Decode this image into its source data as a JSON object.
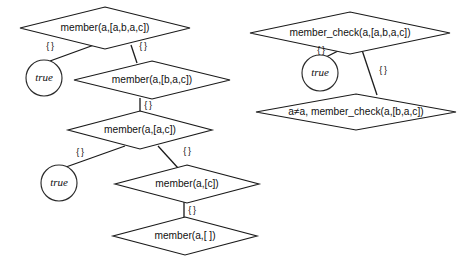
{
  "diagram": {
    "type": "sld-resolution-tree",
    "background_color": "#ffffff",
    "stroke_color": "#1a1a1a",
    "text_color": "#111111",
    "empty_substitution_label": "{ }",
    "trees": [
      {
        "id": "member-tree",
        "name": "member-resolution-tree",
        "root_predicate": "member",
        "nodes": [
          {
            "id": "m0",
            "name": "goal-node-member-abac",
            "shape": "diamond",
            "label": "member(a,[a,b,a,c])",
            "cx": 105,
            "cy": 28,
            "rx": 85,
            "ry": 21
          },
          {
            "id": "m1true",
            "name": "success-node-true-1",
            "shape": "circle",
            "label": "true",
            "cx": 44,
            "cy": 78,
            "r": 18
          },
          {
            "id": "m1",
            "name": "goal-node-member-bac",
            "shape": "diamond",
            "label": "member(a,[b,a,c])",
            "cx": 152,
            "cy": 80,
            "rx": 78,
            "ry": 19
          },
          {
            "id": "m2",
            "name": "goal-node-member-ac",
            "shape": "diamond",
            "label": "member(a,[a,c])",
            "cx": 140,
            "cy": 130,
            "rx": 72,
            "ry": 19
          },
          {
            "id": "m3true",
            "name": "success-node-true-2",
            "shape": "circle",
            "label": "true",
            "cx": 59,
            "cy": 183,
            "r": 18
          },
          {
            "id": "m3",
            "name": "goal-node-member-c",
            "shape": "diamond",
            "label": "member(a,[c])",
            "cx": 187,
            "cy": 184,
            "rx": 72,
            "ry": 19
          },
          {
            "id": "m4",
            "name": "goal-node-member-empty",
            "shape": "diamond",
            "label": "member(a,[ ])",
            "cx": 185,
            "cy": 236,
            "rx": 72,
            "ry": 19
          }
        ],
        "edges": [
          {
            "id": "me0",
            "name": "edge-member-abac-to-true",
            "from": "m0",
            "to": "m1true",
            "x1": 94,
            "y1": 45,
            "x2": 50,
            "y2": 61,
            "label": "{ }",
            "lx": 50,
            "ly": 47
          },
          {
            "id": "me1",
            "name": "edge-member-abac-to-bac",
            "from": "m0",
            "to": "m1",
            "x1": 131,
            "y1": 45,
            "x2": 137,
            "y2": 63,
            "label": "{ }",
            "lx": 143,
            "ly": 47
          },
          {
            "id": "me2",
            "name": "edge-member-bac-to-ac",
            "from": "m1",
            "to": "m2",
            "x1": 140,
            "y1": 98,
            "x2": 140,
            "y2": 113,
            "label": "{ }",
            "lx": 148,
            "ly": 106
          },
          {
            "id": "me3",
            "name": "edge-member-ac-to-true",
            "from": "m2",
            "to": "m3true",
            "x1": 125,
            "y1": 146,
            "x2": 66,
            "y2": 167,
            "label": "{ }",
            "lx": 80,
            "ly": 153
          },
          {
            "id": "me4",
            "name": "edge-member-ac-to-c",
            "from": "m2",
            "to": "m3",
            "x1": 158,
            "y1": 146,
            "x2": 178,
            "y2": 168,
            "label": "{ }",
            "lx": 187,
            "ly": 152
          },
          {
            "id": "me5",
            "name": "edge-member-c-to-empty",
            "from": "m3",
            "to": "m4",
            "x1": 184,
            "y1": 202,
            "x2": 184,
            "y2": 219,
            "label": "{ }",
            "lx": 192,
            "ly": 211
          }
        ]
      },
      {
        "id": "member-check-tree",
        "name": "member-check-resolution-tree",
        "root_predicate": "member_check",
        "nodes": [
          {
            "id": "c0",
            "name": "goal-node-member-check-abac",
            "shape": "diamond",
            "label": "member_check(a,[a,b,a,c])",
            "cx": 350,
            "cy": 33,
            "rx": 100,
            "ry": 21
          },
          {
            "id": "c1true",
            "name": "success-node-true-3",
            "shape": "circle",
            "label": "true",
            "cx": 320,
            "cy": 73,
            "r": 18
          },
          {
            "id": "c1",
            "name": "goal-node-member-check-bac",
            "shape": "diamond",
            "label": "a≠a, member_check(a,[b,a,c])",
            "cx": 356,
            "cy": 112,
            "rx": 100,
            "ry": 18
          }
        ],
        "edges": [
          {
            "id": "ce0",
            "name": "edge-check-abac-to-true",
            "from": "c0",
            "to": "c1true",
            "x1": 340,
            "y1": 50,
            "x2": 326,
            "y2": 57,
            "label": "{ }",
            "lx": 321,
            "ly": 51
          },
          {
            "id": "ce1",
            "name": "edge-check-abac-to-bac",
            "from": "c0",
            "to": "c1",
            "x1": 362,
            "y1": 50,
            "x2": 377,
            "y2": 95,
            "label": "{ }",
            "lx": 383,
            "ly": 71
          }
        ]
      }
    ]
  }
}
